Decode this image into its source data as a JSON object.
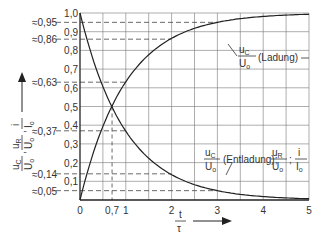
{
  "chart_data": {
    "type": "line",
    "title": "",
    "xlabel": "t/τ",
    "ylabel": "u_C/U_0, u_R/U_0, i/I_0",
    "xlim": [
      0,
      5
    ],
    "ylim": [
      0,
      1.0
    ],
    "grid": true,
    "x_ticks": [
      "0",
      "0,7",
      "1",
      "2",
      "3",
      "4",
      "5"
    ],
    "y_ticks": [
      "0,1",
      "0,2",
      "0,3",
      "0,4",
      "0,5",
      "0,6",
      "0,7",
      "0,8",
      "0,9",
      "1,0"
    ],
    "y_origin_label": "0",
    "reference_lines": [
      {
        "label": "≈0,95",
        "y": 0.95,
        "x_end": 3
      },
      {
        "label": "≈0,86",
        "y": 0.86,
        "x_end": 2
      },
      {
        "label": "≈0,63",
        "y": 0.63,
        "x_end": 1
      },
      {
        "label": "≈0,37",
        "y": 0.37,
        "x_end": 1
      },
      {
        "label": "≈0,14",
        "y": 0.14,
        "x_end": 2
      },
      {
        "label": "≈0,05",
        "y": 0.05,
        "x_end": 3
      }
    ],
    "vertical_reference": {
      "x": 0.7,
      "label": "0,7"
    },
    "series": [
      {
        "name": "u_C/U_0 (Ladung)",
        "x": [
          0,
          0.5,
          0.7,
          1,
          1.5,
          2,
          2.5,
          3,
          3.5,
          4,
          4.5,
          5
        ],
        "values": [
          0,
          0.39,
          0.5,
          0.63,
          0.78,
          0.86,
          0.92,
          0.95,
          0.97,
          0.98,
          0.99,
          0.99
        ]
      },
      {
        "name": "u_C/U_0 (Entladung); u_R/U_0; i/I_0",
        "x": [
          0,
          0.5,
          0.7,
          1,
          1.5,
          2,
          2.5,
          3,
          3.5,
          4,
          4.5,
          5
        ],
        "values": [
          1.0,
          0.61,
          0.5,
          0.37,
          0.22,
          0.14,
          0.08,
          0.05,
          0.03,
          0.02,
          0.01,
          0.01
        ]
      }
    ],
    "annotations": [
      {
        "text_num": "u",
        "text_sub": "C",
        "den": "U",
        "den_sub": "o",
        "suffix": "(Ladung)"
      },
      {
        "text": "(Entladung);"
      }
    ]
  },
  "labels": {
    "y0": "0",
    "x_axis_num": "t",
    "x_axis_den": "τ",
    "ladung": "(Ladung)",
    "entladung": "(Entladung);"
  }
}
